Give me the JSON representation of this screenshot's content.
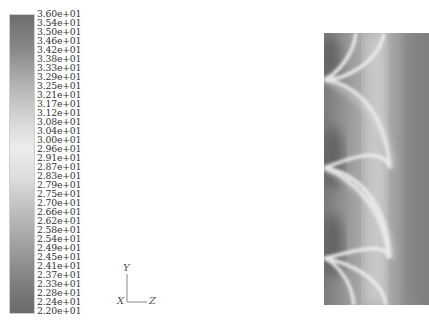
{
  "chart_data": {
    "type": "heatmap",
    "title": "",
    "colormap": "grayscale (dark at extremes, light at midrange)",
    "colorbar": {
      "min": 22.0,
      "max": 36.0,
      "tick_labels": [
        "3.60e+01",
        "3.54e+01",
        "3.50e+01",
        "3.46e+01",
        "3.42e+01",
        "3.38e+01",
        "3.33e+01",
        "3.29e+01",
        "3.25e+01",
        "3.21e+01",
        "3.17e+01",
        "3.12e+01",
        "3.08e+01",
        "3.04e+01",
        "3.00e+01",
        "2.96e+01",
        "2.91e+01",
        "2.87e+01",
        "2.83e+01",
        "2.79e+01",
        "2.75e+01",
        "2.70e+01",
        "2.66e+01",
        "2.62e+01",
        "2.58e+01",
        "2.54e+01",
        "2.49e+01",
        "2.45e+01",
        "2.41e+01",
        "2.37e+01",
        "2.33e+01",
        "2.28e+01",
        "2.24e+01",
        "2.20e+01"
      ],
      "colors": {
        "top": "#6e6e6e",
        "middle": "#e8e8e8",
        "bottom": "#6a6a6a"
      }
    },
    "axes_triad": {
      "vertical": "Y",
      "horizontal": "Z",
      "origin": "X"
    },
    "field_description": "Vertical strip contour plot with periodic light arcs converging to cusps on the left edge at roughly y=80, 170, 255 px; darker regions on left between cusps and along right edge",
    "cusps_y_fraction": [
      0.17,
      0.5,
      0.82
    ]
  },
  "triad": {
    "y_label": "Y",
    "x_label": "X",
    "z_label": "Z"
  }
}
